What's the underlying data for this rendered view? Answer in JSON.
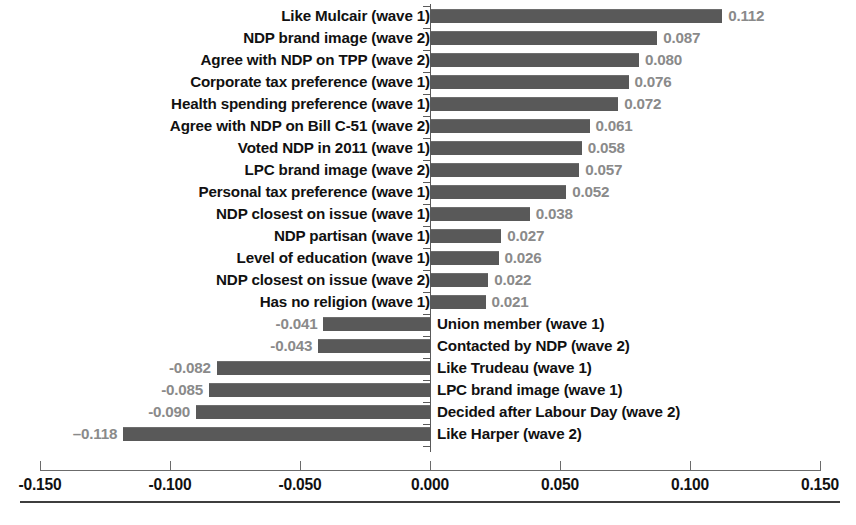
{
  "chart_data": {
    "type": "bar",
    "orientation": "horizontal",
    "title": "",
    "xlabel": "",
    "ylabel": "",
    "xlim": [
      -0.15,
      0.15
    ],
    "xticks": [
      "-0.150",
      "-0.100",
      "-0.050",
      "0.000",
      "0.050",
      "0.100",
      "0.150"
    ],
    "xtick_values": [
      -0.15,
      -0.1,
      -0.05,
      0.0,
      0.05,
      0.1,
      0.15
    ],
    "grid": false,
    "legend": "none",
    "bar_color": "#595959",
    "value_label_color": "#8a8a8a",
    "categories": [
      "Like Mulcair (wave 1)",
      "NDP brand image (wave 2)",
      "Agree with NDP on TPP (wave 2)",
      "Corporate tax preference (wave 1)",
      "Health spending preference (wave 1)",
      "Agree with NDP on Bill C-51 (wave 2)",
      "Voted NDP in 2011 (wave 1)",
      "LPC brand image (wave 2)",
      "Personal tax preference (wave 1)",
      "NDP closest on issue (wave 1)",
      "NDP partisan (wave 1)",
      "Level of education (wave 1)",
      "NDP closest on issue (wave 2)",
      "Has no religion (wave 1)",
      "Union member (wave 1)",
      "Contacted by NDP (wave 2)",
      "Like Trudeau (wave 1)",
      "LPC brand image (wave 1)",
      "Decided after Labour Day (wave 2)",
      "Like Harper (wave 2)"
    ],
    "values": [
      0.112,
      0.087,
      0.08,
      0.076,
      0.072,
      0.061,
      0.058,
      0.057,
      0.052,
      0.038,
      0.027,
      0.026,
      0.022,
      0.021,
      -0.041,
      -0.043,
      -0.082,
      -0.085,
      -0.09,
      -0.118
    ],
    "value_labels": [
      "0.112",
      "0.087",
      "0.080",
      "0.076",
      "0.072",
      "0.061",
      "0.058",
      "0.057",
      "0.052",
      "0.038",
      "0.027",
      "0.026",
      "0.022",
      "0.021",
      "-0.041",
      "-0.043",
      "-0.082",
      "-0.085",
      "-0.090",
      "–0.118"
    ]
  }
}
